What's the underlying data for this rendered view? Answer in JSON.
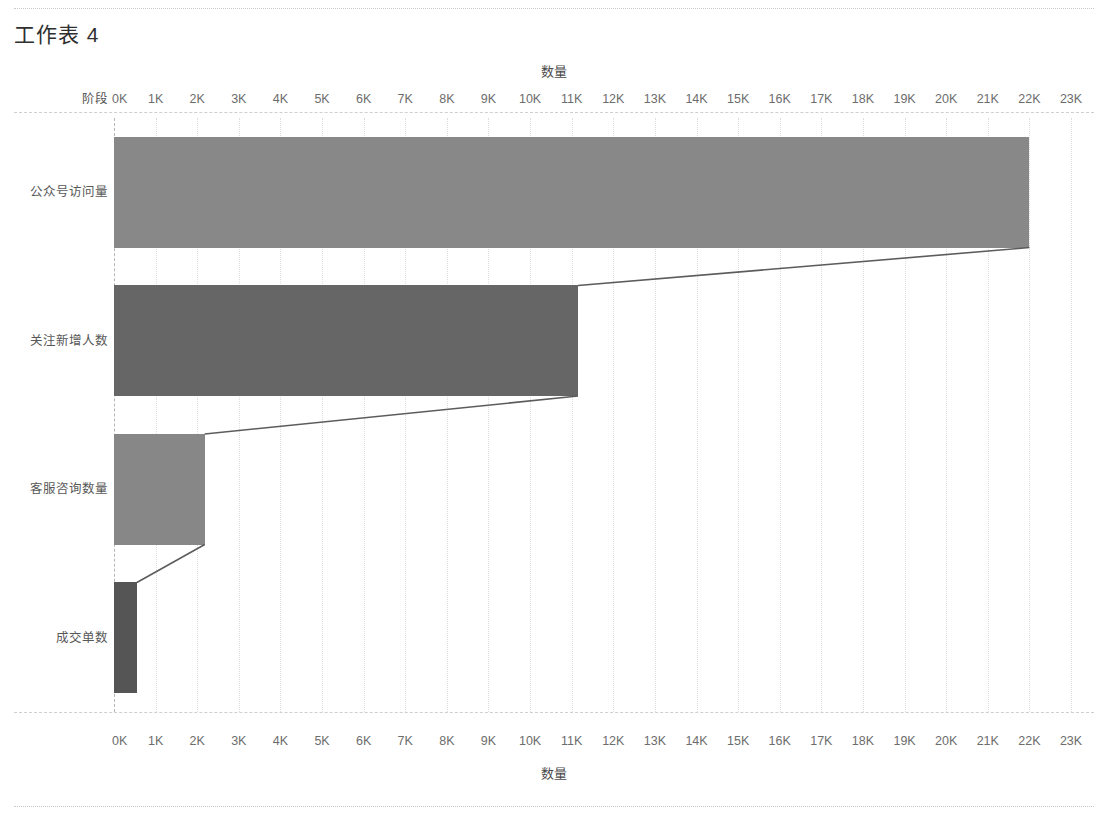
{
  "sheet": {
    "title": "工作表 4"
  },
  "chart_data": {
    "type": "bar",
    "orientation": "horizontal",
    "title": "",
    "xlabel": "数量",
    "ylabel": "阶段",
    "categories": [
      "公众号访问量",
      "关注新增人数",
      "客服咨询数量",
      "成交单数"
    ],
    "values": [
      22000,
      11150,
      2180,
      550
    ],
    "xlim": [
      0,
      23000
    ],
    "x_tick_labels": [
      "0K",
      "1K",
      "2K",
      "3K",
      "4K",
      "5K",
      "6K",
      "7K",
      "8K",
      "9K",
      "10K",
      "11K",
      "12K",
      "13K",
      "14K",
      "15K",
      "16K",
      "17K",
      "18K",
      "19K",
      "20K",
      "21K",
      "22K",
      "23K"
    ],
    "x_tick_values": [
      0,
      1000,
      2000,
      3000,
      4000,
      5000,
      6000,
      7000,
      8000,
      9000,
      10000,
      11000,
      12000,
      13000,
      14000,
      15000,
      16000,
      17000,
      18000,
      19000,
      20000,
      21000,
      22000,
      23000
    ],
    "grid": true,
    "legend": "none",
    "axis_titles": {
      "top": "数量",
      "bottom": "数量",
      "left": "阶段"
    },
    "bar_colors": [
      "#888888",
      "#666666",
      "#878787",
      "#555555"
    ],
    "connector_color": "#5c5c5c",
    "connectors": [
      {
        "from_value": 22000,
        "to_value": 11150
      },
      {
        "from_value": 11150,
        "to_value": 2180
      },
      {
        "from_value": 2180,
        "to_value": 550
      }
    ]
  }
}
